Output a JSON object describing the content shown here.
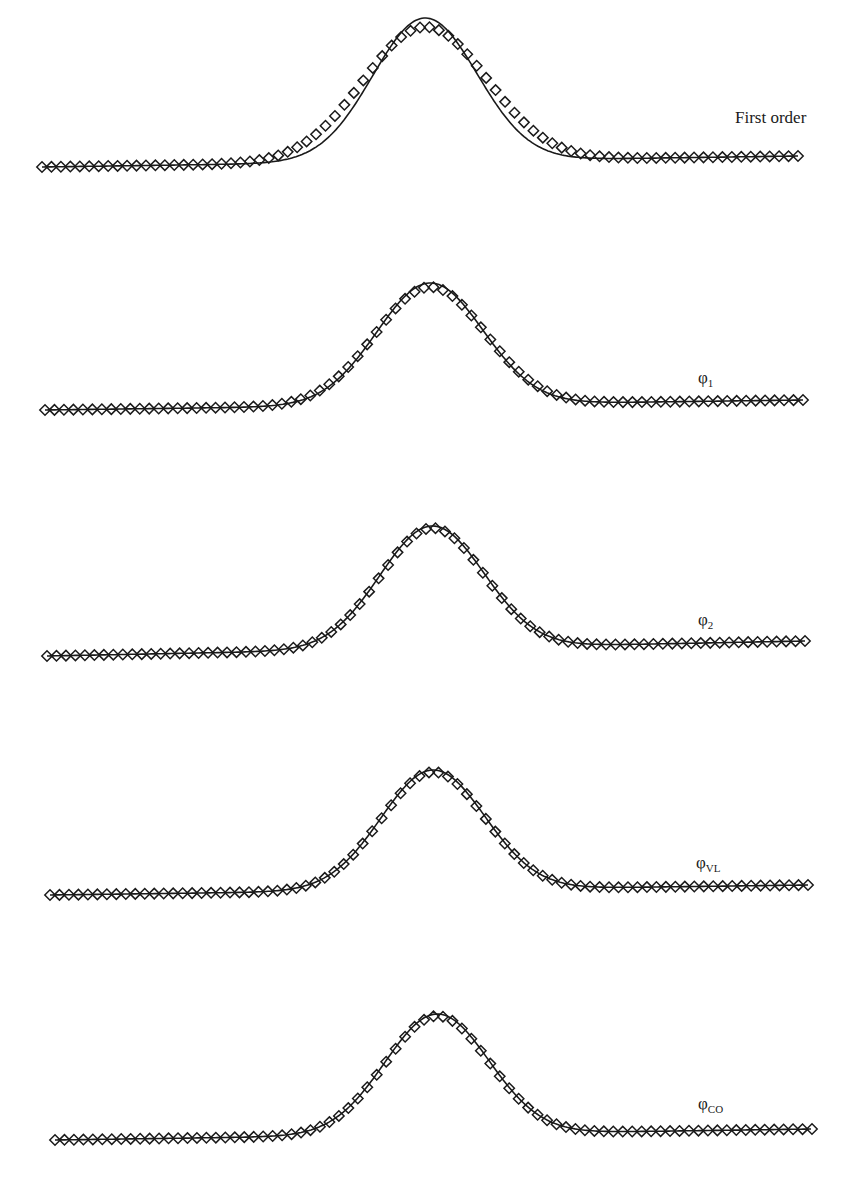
{
  "chart_data": [
    {
      "type": "line",
      "title": "",
      "label": "First order",
      "label_main": "First order",
      "label_sub": "",
      "xlabel": "",
      "ylabel": "",
      "grid": false,
      "series": [
        {
          "name": "numerical (diamonds)",
          "marker": "diamond",
          "peak": 0.93
        },
        {
          "name": "exact (solid line)",
          "marker": "none",
          "peak": 1.0
        }
      ],
      "geometry": {
        "x0": 42,
        "x1": 798,
        "base_left": 167,
        "base_right": 156,
        "peak_x": 425,
        "line_peak_y": 18,
        "marker_peak_y": 27,
        "marker_sigma": 62,
        "line_sigma": 52,
        "n_markers": 81
      },
      "label_pos": {
        "x": 735,
        "y": 108
      }
    },
    {
      "type": "line",
      "label": "φ1",
      "label_main": "φ",
      "label_sub": "1",
      "grid": false,
      "series": [
        {
          "name": "numerical (diamonds)",
          "marker": "diamond",
          "peak": 0.98
        },
        {
          "name": "exact (solid line)",
          "marker": "none",
          "peak": 1.0
        }
      ],
      "geometry": {
        "x0": 45,
        "x1": 803,
        "base_left": 410,
        "base_right": 400,
        "peak_x": 430,
        "line_peak_y": 283,
        "marker_peak_y": 287,
        "marker_sigma": 55,
        "line_sigma": 53,
        "n_markers": 81
      },
      "label_pos": {
        "x": 698,
        "y": 368
      }
    },
    {
      "type": "line",
      "label": "φ2",
      "label_main": "φ",
      "label_sub": "2",
      "grid": false,
      "series": [
        {
          "name": "numerical (diamonds)",
          "marker": "diamond",
          "peak": 0.99
        },
        {
          "name": "exact (solid line)",
          "marker": "none",
          "peak": 1.0
        }
      ],
      "geometry": {
        "x0": 47,
        "x1": 805,
        "base_left": 656,
        "base_right": 641,
        "peak_x": 432,
        "line_peak_y": 526,
        "marker_peak_y": 528,
        "marker_sigma": 52,
        "line_sigma": 52,
        "n_markers": 81
      },
      "label_pos": {
        "x": 698,
        "y": 610
      }
    },
    {
      "type": "line",
      "label": "φVL",
      "label_main": "φ",
      "label_sub": "VL",
      "grid": false,
      "series": [
        {
          "name": "numerical (diamonds)",
          "marker": "diamond",
          "peak": 0.99
        },
        {
          "name": "exact (solid line)",
          "marker": "none",
          "peak": 1.0
        }
      ],
      "geometry": {
        "x0": 50,
        "x1": 808,
        "base_left": 895,
        "base_right": 885,
        "peak_x": 433,
        "line_peak_y": 770,
        "marker_peak_y": 772,
        "marker_sigma": 52,
        "line_sigma": 52,
        "n_markers": 81
      },
      "label_pos": {
        "x": 696,
        "y": 853
      }
    },
    {
      "type": "line",
      "label": "φCO",
      "label_main": "φ",
      "label_sub": "CO",
      "grid": false,
      "series": [
        {
          "name": "numerical (diamonds)",
          "marker": "diamond",
          "peak": 0.99
        },
        {
          "name": "exact (solid line)",
          "marker": "none",
          "peak": 1.0
        }
      ],
      "geometry": {
        "x0": 55,
        "x1": 812,
        "base_left": 1140,
        "base_right": 1129,
        "peak_x": 437,
        "line_peak_y": 1014,
        "marker_peak_y": 1016,
        "marker_sigma": 52,
        "line_sigma": 52,
        "n_markers": 81
      },
      "label_pos": {
        "x": 698,
        "y": 1094
      }
    }
  ],
  "style": {
    "ink": "#1a1a1a",
    "background": "#ffffff"
  }
}
